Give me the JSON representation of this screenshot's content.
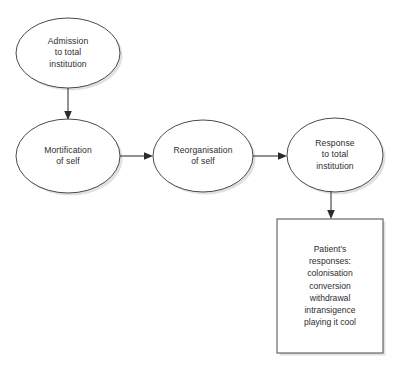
{
  "diagram": {
    "type": "flowchart",
    "background_color": "#ffffff",
    "stroke_color": "#4a4a4a",
    "text_color": "#2d2d2d",
    "nodes": [
      {
        "id": "admission",
        "shape": "ellipse",
        "label": "Admission\nto total\ninstitution",
        "cx": 68,
        "cy": 53,
        "rx": 52,
        "ry": 35
      },
      {
        "id": "mortification",
        "shape": "ellipse",
        "label": "Mortification\nof self",
        "cx": 68,
        "cy": 156,
        "rx": 52,
        "ry": 37
      },
      {
        "id": "reorganisation",
        "shape": "ellipse",
        "label": "Reorganisation\nof self",
        "cx": 203,
        "cy": 156,
        "rx": 50,
        "ry": 36
      },
      {
        "id": "response",
        "shape": "ellipse",
        "label": "Response\nto total\ninstitution",
        "cx": 335,
        "cy": 155,
        "rx": 48,
        "ry": 37
      },
      {
        "id": "patient-responses",
        "shape": "rectangle",
        "label": "Patient's\nresponses:\ncolonisation\nconversion\nwithdrawal\nintransigence\nplaying it cool",
        "x": 277,
        "y": 219,
        "width": 106,
        "height": 134
      }
    ],
    "edges": [
      {
        "id": "admission-to-mortification",
        "from": "admission",
        "to": "mortification",
        "orientation": "vertical"
      },
      {
        "id": "mortification-to-reorganisation",
        "from": "mortification",
        "to": "reorganisation",
        "orientation": "horizontal"
      },
      {
        "id": "reorganisation-to-response",
        "from": "reorganisation",
        "to": "response",
        "orientation": "horizontal"
      },
      {
        "id": "response-to-patient-responses",
        "from": "response",
        "to": "patient-responses",
        "orientation": "vertical"
      }
    ]
  }
}
